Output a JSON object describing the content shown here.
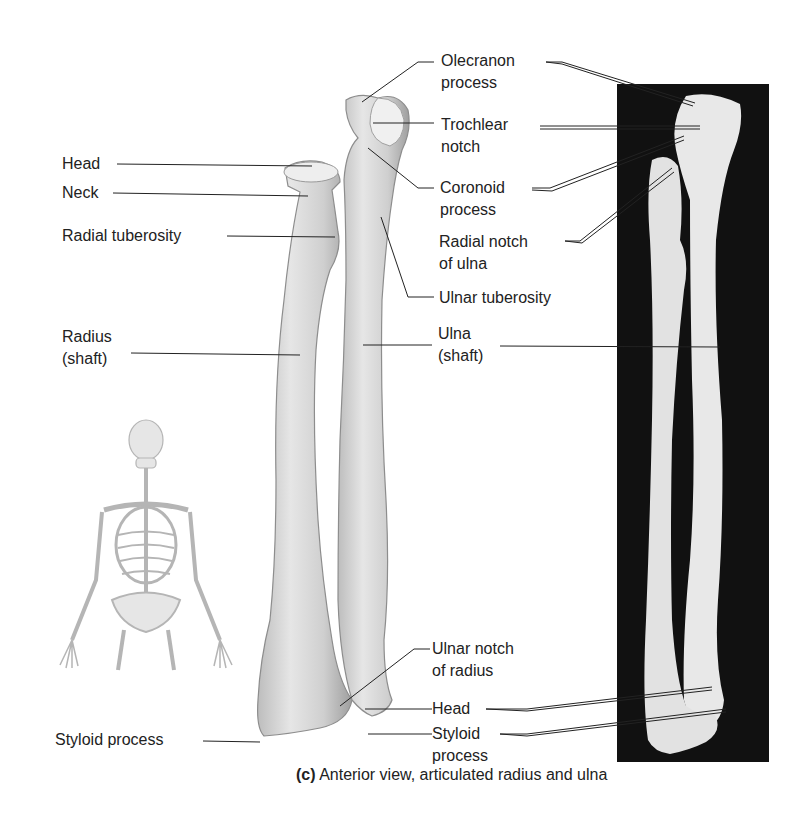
{
  "figure": {
    "caption_prefix": "(c)",
    "caption_text": "Anterior view, articulated radius and ulna"
  },
  "labels_left": {
    "head": "Head",
    "neck": "Neck",
    "radial_tuberosity": "Radial tuberosity",
    "radius_shaft_1": "Radius",
    "radius_shaft_2": "(shaft)",
    "styloid_process": "Styloid process"
  },
  "labels_right": {
    "olecranon_1": "Olecranon",
    "olecranon_2": "process",
    "trochlear_1": "Trochlear",
    "trochlear_2": "notch",
    "coronoid_1": "Coronoid",
    "coronoid_2": "process",
    "radial_notch_1": "Radial notch",
    "radial_notch_2": "of ulna",
    "ulnar_tuberosity": "Ulnar tuberosity",
    "ulna_shaft_1": "Ulna",
    "ulna_shaft_2": "(shaft)",
    "ulnar_notch_1": "Ulnar notch",
    "ulnar_notch_2": "of radius",
    "head": "Head",
    "styloid_1": "Styloid",
    "styloid_2": "process"
  },
  "colors": {
    "bone_fill": "#d9d9d9",
    "bone_shade": "#a8a8a8",
    "photo_bg": "#111111",
    "photo_bone": "#e9e9e9",
    "leader_line": "#222222"
  }
}
